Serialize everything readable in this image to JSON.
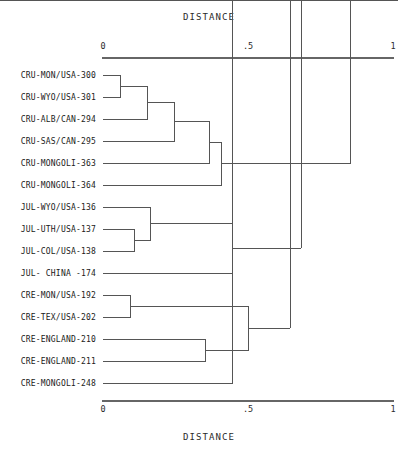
{
  "chart_data": {
    "type": "dendrogram",
    "title": "DISTANCE",
    "xlabel": "DISTANCE",
    "ylabel": "",
    "axis_title_top": "DISTANCE",
    "axis_title_bottom": "DISTANCE",
    "xlim": [
      0,
      1
    ],
    "grid": false,
    "legend": "none",
    "orientation": "horizontal",
    "tick_values": [
      0,
      0.5,
      1
    ],
    "tick_labels": [
      "0",
      ".5",
      "1"
    ],
    "leaves": [
      "CRU-MON/USA-300",
      "CRU-WYO/USA-301",
      "CRU-ALB/CAN-294",
      "CRU-SAS/CAN-295",
      "CRU-MONGOLI-363",
      "CRU-MONGOLI-364",
      "JUL-WYO/USA-136",
      "JUL-UTH/USA-137",
      "JUL-COL/USA-138",
      "JUL- CHINA -174",
      "CRE-MON/USA-192",
      "CRE-TEX/USA-202",
      "CRE-ENGLAND-210",
      "CRE-ENGLAND-211",
      "CRE-MONGOLI-248",
      "CRE-MONGOLI-252"
    ],
    "leaf_count": 15,
    "merges": [
      {
        "id": "m1",
        "left": "CRU-MON/USA-300",
        "right": "CRU-WYO/USA-301",
        "distance": 0.062
      },
      {
        "id": "m2",
        "left": "m1",
        "right": "CRU-ALB/CAN-294",
        "distance": 0.155
      },
      {
        "id": "m3",
        "left": "m2",
        "right": "CRU-SAS/CAN-295",
        "distance": 0.248
      },
      {
        "id": "m4",
        "left": "m3",
        "right": "CRU-MONGOLI-363",
        "distance": 0.368
      },
      {
        "id": "m5",
        "left": "m4",
        "right": "CRU-MONGOLI-364",
        "distance": 0.409
      },
      {
        "id": "m6",
        "left": "JUL-UTH/USA-137",
        "right": "JUL-COL/USA-138",
        "distance": 0.11
      },
      {
        "id": "m7",
        "left": "JUL-WYO/USA-136",
        "right": "m6",
        "distance": 0.165
      },
      {
        "id": "m8",
        "left": "m7",
        "right": "JUL- CHINA -174",
        "distance": 0.447
      },
      {
        "id": "m9",
        "left": "CRE-MON/USA-192",
        "right": "CRE-TEX/USA-202",
        "distance": 0.096
      },
      {
        "id": "m10",
        "left": "CRE-ENGLAND-210",
        "right": "CRE-ENGLAND-211",
        "distance": 0.354
      },
      {
        "id": "m11",
        "left": "m9",
        "right": "m10",
        "distance": 0.502
      },
      {
        "id": "m12",
        "left": "CRE-MONGOLI-248",
        "right": "CRE-MONGOLI-252",
        "distance": 0.447
      },
      {
        "id": "m13",
        "left": "m11",
        "right": "m12",
        "distance": 0.646
      },
      {
        "id": "m14",
        "left": "m8",
        "right": "m13",
        "distance": 0.684
      },
      {
        "id": "m15",
        "left": "m5",
        "right": "m14",
        "distance": 0.852
      }
    ]
  },
  "axis": {
    "top_title": "DISTANCE",
    "bottom_title": "DISTANCE",
    "ticks": [
      {
        "label": "0",
        "value": 0
      },
      {
        "label": ".5",
        "value": 0.5
      },
      {
        "label": "1",
        "value": 1
      }
    ]
  }
}
